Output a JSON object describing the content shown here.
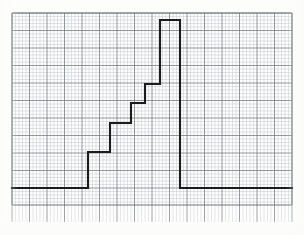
{
  "document": {
    "kind": "graph-paper-scan",
    "title": "Staircase waveform traced on millimeter graph paper",
    "background_color": "#fdfdfc"
  },
  "grid": {
    "label": "millimeter-graph-paper",
    "left": 12,
    "top": 13,
    "right": 292,
    "bottom": 205,
    "tick_strip_bottom": 222,
    "minor_spacing": 3.5,
    "major_every": 5,
    "minor_color": "#b9bfc6",
    "major_color": "#6e757d",
    "border_color": "#5d646b",
    "minor_width": 0.5,
    "major_width": 0.9
  },
  "chart_data": {
    "type": "line",
    "subtitle": "",
    "xlabel": "",
    "ylabel": "",
    "grid": true,
    "legend": false,
    "legend_position": "none",
    "axis_tick_labels": [],
    "xlim": [
      12,
      292
    ],
    "ylim_pixels": [
      13,
      205
    ],
    "trace_color": "#1c1c1c",
    "trace_width": 2.1,
    "baseline_y": 188,
    "peak_y": 20,
    "series": [
      {
        "name": "staircase",
        "points": [
          [
            12,
            188
          ],
          [
            88,
            188
          ],
          [
            88,
            152
          ],
          [
            110,
            152
          ],
          [
            110,
            123
          ],
          [
            131,
            123
          ],
          [
            131,
            103
          ],
          [
            145,
            103
          ],
          [
            145,
            84
          ],
          [
            160,
            84
          ],
          [
            160,
            20
          ],
          [
            180,
            20
          ],
          [
            180,
            188
          ],
          [
            292,
            188
          ]
        ]
      }
    ],
    "steps": [
      {
        "index": 1,
        "riser_x": 88,
        "from_y": 188,
        "to_y": 152,
        "tread_to_x": 110
      },
      {
        "index": 2,
        "riser_x": 110,
        "from_y": 152,
        "to_y": 123,
        "tread_to_x": 131
      },
      {
        "index": 3,
        "riser_x": 131,
        "from_y": 123,
        "to_y": 103,
        "tread_to_x": 145
      },
      {
        "index": 4,
        "riser_x": 145,
        "from_y": 103,
        "to_y": 84,
        "tread_to_x": 160
      },
      {
        "index": 5,
        "riser_x": 160,
        "from_y": 84,
        "to_y": 20,
        "tread_to_x": 180
      },
      {
        "index": 6,
        "riser_x": 180,
        "from_y": 20,
        "to_y": 188,
        "tread_to_x": 292
      }
    ]
  }
}
